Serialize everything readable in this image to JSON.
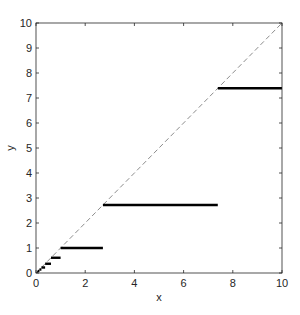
{
  "chart_data": {
    "type": "line",
    "title": "",
    "xlabel": "x",
    "ylabel": "y",
    "xlim": [
      0,
      10
    ],
    "ylim": [
      0,
      10
    ],
    "grid": false,
    "legend": null,
    "xticks": [
      0,
      2,
      4,
      6,
      8,
      10
    ],
    "yticks": [
      0,
      1,
      2,
      3,
      4,
      5,
      6,
      7,
      8,
      9,
      10
    ],
    "series": [
      {
        "name": "identity",
        "style": "dashed",
        "color": "#7f7f7f",
        "x": [
          0,
          10
        ],
        "y": [
          0,
          10
        ]
      },
      {
        "name": "steps",
        "style": "solid-thick",
        "color": "#000000",
        "segments": [
          {
            "x0": 7.39,
            "x1": 10.0,
            "y": 7.39
          },
          {
            "x0": 2.72,
            "x1": 7.39,
            "y": 2.72
          },
          {
            "x0": 1.0,
            "x1": 2.72,
            "y": 1.0
          },
          {
            "x0": 0.61,
            "x1": 1.0,
            "y": 0.61
          },
          {
            "x0": 0.37,
            "x1": 0.61,
            "y": 0.37
          },
          {
            "x0": 0.22,
            "x1": 0.37,
            "y": 0.22
          },
          {
            "x0": 0.14,
            "x1": 0.22,
            "y": 0.14
          },
          {
            "x0": 0.08,
            "x1": 0.14,
            "y": 0.08
          },
          {
            "x0": 0.05,
            "x1": 0.08,
            "y": 0.05
          }
        ]
      }
    ]
  },
  "axes": {
    "x_label": "x",
    "y_label": "y"
  }
}
